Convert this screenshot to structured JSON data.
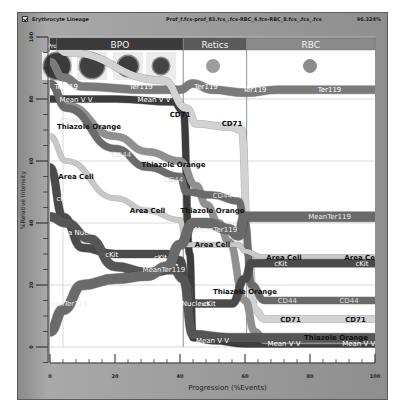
{
  "window": {
    "title": "Erythrocyte Lineage",
    "file": "Prof_f.fcs-prof_83.fcs_.fcs-RBC_4.fcs-RBC_8.fcs_.fcs_.fcs",
    "percent": "96.324%",
    "checkbox_checked": true
  },
  "chart_data": {
    "type": "line",
    "title": "Erythrocyte Lineage",
    "xlabel": "Progression (%Events)",
    "ylabel": "%Relative Intensity",
    "xlim": [
      0,
      100
    ],
    "ylim": [
      -5,
      100
    ],
    "xticks": [
      0,
      20,
      40,
      60,
      80,
      100
    ],
    "yticks": [
      0,
      20,
      40,
      60,
      80,
      100
    ],
    "grid": true,
    "stages": [
      {
        "name": "Pro",
        "x0": 0,
        "x1": 2,
        "color": "#3a3a3a"
      },
      {
        "name": "BPO",
        "x0": 2,
        "x1": 41,
        "color": "#3a3a3a"
      },
      {
        "name": "Retics",
        "x0": 41,
        "x1": 60.5,
        "color": "#5a5a5a"
      },
      {
        "name": "RBC",
        "x0": 60.5,
        "x1": 100,
        "color": "#8a8a8a"
      }
    ],
    "stage_dividers": [
      41,
      60.5
    ],
    "series": [
      {
        "name": "Ter119",
        "color": "#7a7a7a",
        "width": 8,
        "label_color": "#ffffff",
        "x": [
          0,
          4,
          10,
          30,
          40,
          44,
          50,
          60,
          70,
          100
        ],
        "y": [
          92,
          87,
          84,
          83,
          83,
          85,
          83,
          82,
          83,
          83
        ],
        "labels": [
          {
            "x": 5,
            "y": 84
          },
          {
            "x": 28,
            "y": 84
          },
          {
            "x": 48,
            "y": 84
          },
          {
            "x": 63,
            "y": 83
          },
          {
            "x": 86,
            "y": 83
          }
        ]
      },
      {
        "name": "Mean V V",
        "color": "#3c3c3c",
        "width": 7,
        "label_color": "#ffffff",
        "x": [
          0,
          4,
          20,
          38,
          41,
          43,
          44,
          50,
          60,
          100
        ],
        "y": [
          80,
          80,
          80,
          79,
          76,
          30,
          3,
          2,
          1,
          1
        ],
        "labels": [
          {
            "x": 8,
            "y": 80
          },
          {
            "x": 32,
            "y": 80
          },
          {
            "x": 50,
            "y": 2
          },
          {
            "x": 72,
            "y": 1
          },
          {
            "x": 95,
            "y": 1
          }
        ]
      },
      {
        "name": "CD71",
        "color": "#d2d2d2",
        "width": 7,
        "label_color": "#111111",
        "x": [
          0,
          5,
          35,
          42,
          45,
          55,
          59,
          61,
          63,
          66,
          100
        ],
        "y": [
          100,
          95,
          86,
          77,
          72,
          71,
          70,
          30,
          12,
          9,
          9
        ],
        "labels": [
          {
            "x": 40,
            "y": 75
          },
          {
            "x": 56,
            "y": 72
          },
          {
            "x": 74,
            "y": 9
          },
          {
            "x": 94,
            "y": 9
          }
        ]
      },
      {
        "name": "Thiazole Orange",
        "color": "#909090",
        "width": 7,
        "label_color": "#111111",
        "x": [
          0,
          5,
          20,
          30,
          40,
          45,
          48,
          52,
          55,
          60,
          63,
          66,
          100
        ],
        "y": [
          85,
          78,
          68,
          63,
          60,
          52,
          46,
          40,
          34,
          15,
          5,
          2,
          2
        ],
        "labels": [
          {
            "x": 12,
            "y": 71
          },
          {
            "x": 38,
            "y": 59
          },
          {
            "x": 50,
            "y": 44
          },
          {
            "x": 60,
            "y": 18
          },
          {
            "x": 88,
            "y": 3
          }
        ]
      },
      {
        "name": "CD44",
        "color": "#6a6a6a",
        "width": 7,
        "label_color": "#dddddd",
        "x": [
          0,
          5,
          20,
          30,
          40,
          42,
          50,
          58,
          60,
          62,
          66,
          100
        ],
        "y": [
          85,
          77,
          64,
          58,
          55,
          50,
          49,
          47,
          40,
          20,
          15,
          15
        ],
        "labels": [
          {
            "x": 6,
            "y": 73
          },
          {
            "x": 22,
            "y": 62
          },
          {
            "x": 38,
            "y": 54
          },
          {
            "x": 53,
            "y": 49
          },
          {
            "x": 73,
            "y": 15
          },
          {
            "x": 92,
            "y": 15
          }
        ]
      },
      {
        "name": "Area Cell",
        "color": "#c8c8c8",
        "width": 5,
        "label_color": "#111111",
        "x": [
          0,
          5,
          20,
          30,
          40,
          42,
          50,
          58,
          60,
          65,
          100
        ],
        "y": [
          68,
          60,
          48,
          44,
          41,
          33,
          33,
          33,
          31,
          29,
          29
        ],
        "labels": [
          {
            "x": 8,
            "y": 55
          },
          {
            "x": 30,
            "y": 44
          },
          {
            "x": 50,
            "y": 33
          },
          {
            "x": 72,
            "y": 29
          },
          {
            "x": 96,
            "y": 29
          }
        ]
      },
      {
        "name": "cKit",
        "color": "#4a4a4a",
        "width": 8,
        "label_color": "#ffffff",
        "x": [
          0,
          4,
          10,
          20,
          30,
          36,
          40,
          42,
          44,
          48,
          56,
          60,
          62,
          66,
          100
        ],
        "y": [
          58,
          42,
          32,
          30,
          30,
          30,
          28,
          20,
          14,
          14,
          14,
          22,
          27,
          27,
          27
        ],
        "labels": [
          {
            "x": 4,
            "y": 48
          },
          {
            "x": 19,
            "y": 30
          },
          {
            "x": 34,
            "y": 29
          },
          {
            "x": 49,
            "y": 14
          },
          {
            "x": 71,
            "y": 27
          },
          {
            "x": 96,
            "y": 27
          }
        ]
      },
      {
        "name": "Area Nucleus",
        "color": "#555555",
        "width": 9,
        "label_color": "#ffffff",
        "x": [
          0,
          5,
          12,
          20,
          30,
          38,
          41,
          44,
          55,
          100
        ],
        "y": [
          42,
          40,
          35,
          26,
          24,
          25,
          22,
          4,
          3,
          3
        ],
        "labels": [
          {
            "x": 9,
            "y": 37
          },
          {
            "x": 42,
            "y": 14
          }
        ]
      },
      {
        "name": "MeanTer119",
        "color": "#6a6a6a",
        "width": 10,
        "label_color": "#eeeeee",
        "x": [
          0,
          4,
          10,
          20,
          30,
          36,
          40,
          44,
          48,
          55,
          58,
          60,
          62,
          100
        ],
        "y": [
          5,
          12,
          20,
          22,
          23,
          26,
          33,
          40,
          40,
          38,
          36,
          42,
          42,
          42
        ],
        "labels": [
          {
            "x": 5,
            "y": 14
          },
          {
            "x": 35,
            "y": 25
          },
          {
            "x": 51,
            "y": 38
          },
          {
            "x": 86,
            "y": 42
          }
        ]
      }
    ]
  }
}
